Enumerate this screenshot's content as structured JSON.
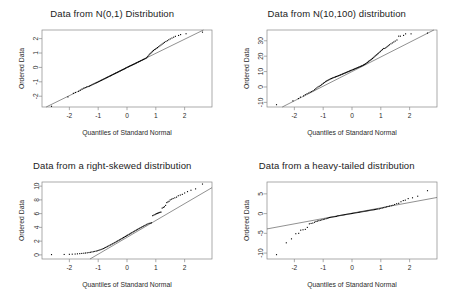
{
  "figure": {
    "layout": "2x2 grid of Q-Q (quantile-quantile) plots",
    "background_color": "#ffffff",
    "point_color": "#000000",
    "line_color": "#555555",
    "frame_color": "#888888"
  },
  "chart_data": [
    {
      "type": "scatter",
      "title": "Data from N(0,1) Distribution",
      "xlabel": "Quantiles of Standard Normal",
      "ylabel": "Ordered Data",
      "xlim": [
        -2.95,
        2.95
      ],
      "ylim": [
        -2.75,
        2.6
      ],
      "xticks": [
        "-2",
        "-1",
        "0",
        "1",
        "2"
      ],
      "xtick_values": [
        -2,
        -1,
        0,
        1,
        2
      ],
      "yticks": [
        "2",
        "1",
        "0",
        "-1",
        "-2"
      ],
      "ytick_values": [
        2,
        1,
        0,
        -1,
        -2
      ],
      "grid": false,
      "legend": "none",
      "reference_line": {
        "intercept": 0.0,
        "slope": 0.98
      },
      "x": [
        -2.62,
        -2.05,
        -1.86,
        -1.79,
        -1.68,
        -1.62,
        -1.56,
        -1.5,
        -1.45,
        -1.4,
        -1.35,
        -1.3,
        -1.26,
        -1.22,
        -1.18,
        -1.14,
        -1.1,
        -1.06,
        -1.03,
        -0.99,
        -0.96,
        -0.92,
        -0.89,
        -0.86,
        -0.83,
        -0.8,
        -0.77,
        -0.74,
        -0.71,
        -0.68,
        -0.65,
        -0.62,
        -0.59,
        -0.57,
        -0.54,
        -0.51,
        -0.48,
        -0.46,
        -0.43,
        -0.4,
        -0.38,
        -0.35,
        -0.33,
        -0.3,
        -0.28,
        -0.25,
        -0.23,
        -0.2,
        -0.18,
        -0.15,
        -0.13,
        -0.1,
        -0.08,
        -0.05,
        -0.03,
        0.0,
        0.03,
        0.05,
        0.08,
        0.1,
        0.13,
        0.15,
        0.18,
        0.2,
        0.23,
        0.25,
        0.28,
        0.3,
        0.33,
        0.35,
        0.38,
        0.4,
        0.43,
        0.46,
        0.48,
        0.51,
        0.54,
        0.57,
        0.59,
        0.62,
        0.65,
        0.68,
        0.71,
        0.74,
        0.77,
        0.8,
        0.83,
        0.86,
        0.89,
        0.92,
        0.96,
        0.99,
        1.03,
        1.06,
        1.1,
        1.14,
        1.18,
        1.22,
        1.26,
        1.3,
        1.35,
        1.4,
        1.45,
        1.5,
        1.56,
        1.62,
        1.68,
        1.79,
        1.86,
        2.05,
        2.62
      ],
      "y": [
        -2.7,
        -2.05,
        -1.8,
        -1.74,
        -1.66,
        -1.58,
        -1.5,
        -1.44,
        -1.4,
        -1.36,
        -1.33,
        -1.3,
        -1.26,
        -1.22,
        -1.18,
        -1.14,
        -1.1,
        -1.07,
        -1.04,
        -1.0,
        -0.97,
        -0.93,
        -0.9,
        -0.87,
        -0.84,
        -0.81,
        -0.78,
        -0.75,
        -0.72,
        -0.69,
        -0.66,
        -0.63,
        -0.6,
        -0.58,
        -0.55,
        -0.52,
        -0.49,
        -0.47,
        -0.44,
        -0.41,
        -0.39,
        -0.36,
        -0.34,
        -0.31,
        -0.29,
        -0.26,
        -0.24,
        -0.21,
        -0.19,
        -0.16,
        -0.14,
        -0.11,
        -0.09,
        -0.06,
        -0.03,
        0.0,
        0.02,
        0.05,
        0.07,
        0.1,
        0.12,
        0.14,
        0.17,
        0.19,
        0.21,
        0.24,
        0.26,
        0.29,
        0.31,
        0.34,
        0.36,
        0.39,
        0.41,
        0.44,
        0.47,
        0.49,
        0.52,
        0.55,
        0.57,
        0.6,
        0.63,
        0.67,
        0.74,
        0.8,
        0.88,
        0.95,
        1.0,
        1.06,
        1.12,
        1.18,
        1.24,
        1.28,
        1.33,
        1.38,
        1.44,
        1.5,
        1.56,
        1.62,
        1.68,
        1.74,
        1.8,
        1.86,
        1.92,
        1.98,
        2.04,
        2.1,
        2.16,
        2.22,
        2.28,
        2.34,
        2.45
      ]
    },
    {
      "type": "scatter",
      "title": "Data from N(10,100) distribution",
      "xlabel": "Quantiles of Standard Normal",
      "ylabel": "Ordered Data",
      "xlim": [
        -2.95,
        2.95
      ],
      "ylim": [
        -13.0,
        37.0
      ],
      "xticks": [
        "-2",
        "-1",
        "0",
        "1",
        "2"
      ],
      "xtick_values": [
        -2,
        -1,
        0,
        1,
        2
      ],
      "yticks": [
        "30",
        "20",
        "10",
        "0",
        "-10"
      ],
      "ytick_values": [
        30,
        20,
        10,
        0,
        -10
      ],
      "grid": false,
      "legend": "none",
      "reference_line": {
        "intercept": 10.0,
        "slope": 9.5
      },
      "x": [
        -2.62,
        -2.05,
        -1.86,
        -1.79,
        -1.68,
        -1.62,
        -1.56,
        -1.5,
        -1.45,
        -1.4,
        -1.35,
        -1.3,
        -1.26,
        -1.22,
        -1.18,
        -1.14,
        -1.1,
        -1.06,
        -1.03,
        -0.99,
        -0.96,
        -0.92,
        -0.89,
        -0.86,
        -0.83,
        -0.8,
        -0.77,
        -0.74,
        -0.71,
        -0.68,
        -0.65,
        -0.62,
        -0.59,
        -0.57,
        -0.54,
        -0.51,
        -0.48,
        -0.46,
        -0.43,
        -0.4,
        -0.38,
        -0.35,
        -0.33,
        -0.3,
        -0.28,
        -0.25,
        -0.23,
        -0.2,
        -0.18,
        -0.15,
        -0.13,
        -0.1,
        -0.08,
        -0.05,
        -0.03,
        0.0,
        0.03,
        0.05,
        0.08,
        0.1,
        0.13,
        0.15,
        0.18,
        0.2,
        0.23,
        0.25,
        0.28,
        0.3,
        0.33,
        0.35,
        0.38,
        0.4,
        0.43,
        0.46,
        0.48,
        0.51,
        0.54,
        0.57,
        0.59,
        0.62,
        0.65,
        0.68,
        0.71,
        0.74,
        0.77,
        0.8,
        0.83,
        0.86,
        0.89,
        0.92,
        0.96,
        0.99,
        1.03,
        1.06,
        1.1,
        1.14,
        1.18,
        1.22,
        1.26,
        1.3,
        1.35,
        1.4,
        1.45,
        1.5,
        1.56,
        1.62,
        1.68,
        1.79,
        1.86,
        2.05,
        2.62
      ],
      "y": [
        -11.5,
        -9.0,
        -7.5,
        -6.6,
        -5.8,
        -5.0,
        -4.4,
        -3.9,
        -3.4,
        -3.0,
        -2.4,
        -1.8,
        -1.2,
        -0.6,
        0.0,
        0.4,
        0.9,
        1.4,
        1.9,
        2.4,
        2.9,
        3.4,
        3.8,
        4.1,
        4.4,
        4.7,
        5.0,
        5.3,
        5.5,
        5.8,
        6.0,
        6.2,
        6.4,
        6.6,
        6.8,
        7.0,
        7.2,
        7.4,
        7.6,
        7.8,
        8.0,
        8.2,
        8.4,
        8.6,
        8.8,
        9.0,
        9.2,
        9.4,
        9.6,
        9.8,
        10.0,
        10.2,
        10.4,
        10.6,
        10.8,
        11.0,
        11.2,
        11.4,
        11.6,
        11.8,
        12.0,
        12.2,
        12.4,
        12.6,
        12.8,
        13.0,
        13.2,
        13.4,
        13.6,
        13.8,
        14.0,
        14.3,
        14.6,
        14.9,
        15.2,
        15.6,
        16.0,
        16.4,
        16.8,
        17.2,
        17.6,
        18.0,
        18.5,
        19.0,
        19.5,
        20.0,
        20.5,
        21.0,
        21.5,
        22.0,
        22.6,
        23.2,
        23.8,
        24.4,
        25.0,
        25.0,
        25.6,
        26.2,
        26.8,
        27.4,
        28.0,
        28.6,
        29.2,
        29.8,
        30.5,
        33.0,
        33.0,
        33.5,
        34.5,
        34.5,
        35.0
      ]
    },
    {
      "type": "scatter",
      "title": "Data from a right-skewed distribution",
      "xlabel": "Quantiles of Standard Normal",
      "ylabel": "Ordered Data",
      "xlim": [
        -2.95,
        2.95
      ],
      "ylim": [
        -0.6,
        10.6
      ],
      "xticks": [
        "-2",
        "-1",
        "0",
        "1",
        "2"
      ],
      "xtick_values": [
        -2,
        -1,
        0,
        1,
        2
      ],
      "yticks": [
        "10",
        "8",
        "6",
        "4",
        "2",
        "0"
      ],
      "ytick_values": [
        10,
        8,
        6,
        4,
        2,
        0
      ],
      "grid": false,
      "legend": "none",
      "reference_line": {
        "intercept": 2.55,
        "slope": 2.45
      },
      "x": [
        -2.62,
        -2.18,
        -2.0,
        -1.9,
        -1.8,
        -1.72,
        -1.64,
        -1.57,
        -1.5,
        -1.44,
        -1.38,
        -1.32,
        -1.27,
        -1.22,
        -1.17,
        -1.12,
        -1.07,
        -1.03,
        -0.98,
        -0.94,
        -0.9,
        -0.86,
        -0.82,
        -0.78,
        -0.74,
        -0.7,
        -0.67,
        -0.63,
        -0.59,
        -0.56,
        -0.52,
        -0.49,
        -0.45,
        -0.42,
        -0.38,
        -0.35,
        -0.32,
        -0.28,
        -0.25,
        -0.22,
        -0.18,
        -0.15,
        -0.12,
        -0.09,
        -0.05,
        -0.02,
        0.01,
        0.04,
        0.08,
        0.11,
        0.14,
        0.17,
        0.21,
        0.24,
        0.27,
        0.31,
        0.34,
        0.37,
        0.41,
        0.44,
        0.48,
        0.51,
        0.55,
        0.58,
        0.62,
        0.66,
        0.69,
        0.73,
        0.77,
        0.81,
        0.85,
        0.89,
        0.93,
        0.97,
        1.0,
        1.03,
        1.06,
        1.09,
        1.12,
        1.15,
        1.18,
        1.22,
        1.26,
        1.3,
        1.34,
        1.38,
        1.42,
        1.46,
        1.5,
        1.55,
        1.6,
        1.66,
        1.72,
        1.78,
        1.85,
        1.92,
        2.0,
        2.1,
        2.22,
        2.38,
        2.62
      ],
      "y": [
        0.04,
        0.06,
        0.08,
        0.1,
        0.12,
        0.15,
        0.18,
        0.21,
        0.24,
        0.27,
        0.3,
        0.34,
        0.38,
        0.42,
        0.46,
        0.5,
        0.55,
        0.6,
        0.66,
        0.72,
        0.78,
        0.85,
        0.92,
        1.0,
        1.08,
        1.16,
        1.24,
        1.32,
        1.4,
        1.48,
        1.56,
        1.64,
        1.72,
        1.8,
        1.88,
        1.96,
        2.04,
        2.12,
        2.2,
        2.28,
        2.36,
        2.44,
        2.52,
        2.6,
        2.68,
        2.76,
        2.84,
        2.92,
        3.0,
        3.08,
        3.16,
        3.24,
        3.32,
        3.4,
        3.48,
        3.56,
        3.64,
        3.72,
        3.8,
        3.88,
        3.96,
        4.04,
        4.12,
        4.2,
        4.28,
        4.36,
        4.44,
        4.52,
        4.58,
        4.62,
        4.66,
        5.7,
        5.78,
        5.86,
        5.94,
        6.0,
        6.05,
        6.1,
        6.15,
        6.2,
        6.22,
        6.8,
        6.9,
        7.0,
        7.2,
        7.6,
        7.7,
        7.8,
        8.0,
        8.1,
        8.2,
        8.3,
        8.4,
        8.6,
        8.7,
        8.8,
        9.0,
        9.2,
        9.4,
        9.6,
        10.3
      ]
    },
    {
      "type": "scatter",
      "title": "Data from a heavy-tailed distribution",
      "xlabel": "Quantiles of Standard Normal",
      "ylabel": "Ordered Data",
      "xlim": [
        -2.95,
        2.95
      ],
      "ylim": [
        -11.5,
        8.0
      ],
      "xticks": [
        "-2",
        "-1",
        "0",
        "1",
        "2"
      ],
      "xtick_values": [
        -2,
        -1,
        0,
        1,
        2
      ],
      "yticks": [
        "5",
        "0",
        "-5",
        "-10"
      ],
      "ytick_values": [
        5,
        0,
        -5,
        -10
      ],
      "grid": false,
      "legend": "none",
      "reference_line": {
        "intercept": 0.1,
        "slope": 1.35
      },
      "x": [
        -2.62,
        -2.28,
        -2.1,
        -1.95,
        -1.85,
        -1.78,
        -1.7,
        -1.62,
        -1.55,
        -1.48,
        -1.42,
        -1.36,
        -1.3,
        -1.25,
        -1.2,
        -1.15,
        -1.1,
        -1.05,
        -1.0,
        -0.95,
        -0.9,
        -0.86,
        -0.82,
        -0.78,
        -0.74,
        -0.7,
        -0.66,
        -0.62,
        -0.58,
        -0.54,
        -0.5,
        -0.46,
        -0.42,
        -0.38,
        -0.34,
        -0.3,
        -0.26,
        -0.22,
        -0.18,
        -0.14,
        -0.1,
        -0.06,
        -0.02,
        0.02,
        0.06,
        0.1,
        0.14,
        0.18,
        0.22,
        0.26,
        0.3,
        0.34,
        0.38,
        0.42,
        0.46,
        0.5,
        0.54,
        0.58,
        0.62,
        0.66,
        0.7,
        0.74,
        0.78,
        0.82,
        0.86,
        0.9,
        0.95,
        1.0,
        1.05,
        1.1,
        1.15,
        1.2,
        1.25,
        1.3,
        1.36,
        1.42,
        1.48,
        1.55,
        1.62,
        1.7,
        1.78,
        1.85,
        1.95,
        2.1,
        2.28,
        2.62
      ],
      "y": [
        -10.4,
        -7.4,
        -6.4,
        -5.1,
        -5.0,
        -4.2,
        -4.1,
        -4.0,
        -3.5,
        -2.6,
        -2.5,
        -2.4,
        -2.2,
        -2.0,
        -1.9,
        -1.8,
        -1.7,
        -1.6,
        -1.5,
        -1.4,
        -1.3,
        -1.2,
        -1.1,
        -1.0,
        -0.95,
        -0.9,
        -0.85,
        -0.8,
        -0.75,
        -0.7,
        -0.6,
        -0.55,
        -0.5,
        -0.45,
        -0.4,
        -0.35,
        -0.3,
        -0.25,
        -0.2,
        -0.15,
        -0.1,
        -0.05,
        0.0,
        0.05,
        0.1,
        0.15,
        0.2,
        0.25,
        0.3,
        0.35,
        0.4,
        0.45,
        0.5,
        0.55,
        0.6,
        0.65,
        0.7,
        0.75,
        0.8,
        0.85,
        0.9,
        0.95,
        1.0,
        1.05,
        1.1,
        1.15,
        1.2,
        1.3,
        1.4,
        1.5,
        1.6,
        1.7,
        1.8,
        1.9,
        2.0,
        2.1,
        2.3,
        2.5,
        2.6,
        3.0,
        3.3,
        3.4,
        3.8,
        4.0,
        4.4,
        5.8
      ]
    }
  ]
}
